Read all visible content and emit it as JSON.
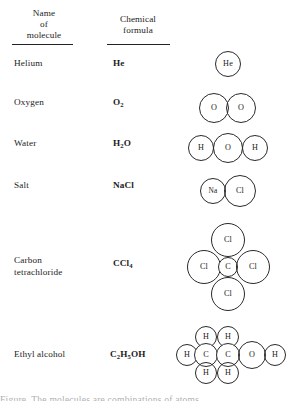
{
  "figure": {
    "kind": "molecular-structure-table",
    "columns": [
      {
        "id": "name",
        "header_lines": [
          "Name",
          "of",
          "molecule"
        ]
      },
      {
        "id": "formula",
        "header_lines": [
          "Chemical",
          "formula"
        ]
      },
      {
        "id": "model",
        "header_lines": []
      }
    ]
  },
  "rows": [
    {
      "name": "Helium",
      "formula": [
        {
          "t": "He"
        }
      ],
      "model": {
        "atoms": [
          {
            "label": "He",
            "cx": 52,
            "cy": 14,
            "r": 13
          }
        ]
      }
    },
    {
      "name": "Oxygen",
      "formula": [
        {
          "t": "O"
        },
        {
          "t": "2",
          "sub": true
        }
      ],
      "model": {
        "atoms": [
          {
            "label": "O",
            "cx": 38,
            "cy": 17,
            "r": 15
          },
          {
            "label": "O",
            "cx": 65,
            "cy": 17,
            "r": 15
          }
        ]
      }
    },
    {
      "name": "Water",
      "formula": [
        {
          "t": "H"
        },
        {
          "t": "2",
          "sub": true
        },
        {
          "t": "O"
        }
      ],
      "model": {
        "atoms": [
          {
            "label": "H",
            "cx": 25,
            "cy": 17,
            "r": 13
          },
          {
            "label": "O",
            "cx": 52,
            "cy": 17,
            "r": 15
          },
          {
            "label": "H",
            "cx": 79,
            "cy": 17,
            "r": 13
          }
        ]
      }
    },
    {
      "name": "Salt",
      "formula": [
        {
          "t": "NaCl"
        }
      ],
      "model": {
        "atoms": [
          {
            "label": "Na",
            "cx": 37,
            "cy": 17,
            "r": 13,
            "small": true
          },
          {
            "label": "Cl",
            "cx": 64,
            "cy": 17,
            "r": 16
          }
        ]
      }
    },
    {
      "name": "Carbon tetrachloride",
      "name_lines": [
        "Carbon",
        "tetrachloride"
      ],
      "formula": [
        {
          "t": "CCl"
        },
        {
          "t": "4",
          "sub": true
        }
      ],
      "model": {
        "atoms": [
          {
            "label": "Cl",
            "cx": 52,
            "cy": 17,
            "r": 17
          },
          {
            "label": "Cl",
            "cx": 28,
            "cy": 44,
            "r": 17
          },
          {
            "label": "C",
            "cx": 52,
            "cy": 44,
            "r": 10
          },
          {
            "label": "Cl",
            "cx": 77,
            "cy": 44,
            "r": 17
          },
          {
            "label": "Cl",
            "cx": 52,
            "cy": 71,
            "r": 17
          }
        ]
      }
    },
    {
      "name": "Ethyl alcohol",
      "formula": [
        {
          "t": "C"
        },
        {
          "t": "2",
          "sub": true
        },
        {
          "t": "H"
        },
        {
          "t": "5",
          "sub": true
        },
        {
          "t": "OH"
        }
      ],
      "model": {
        "atoms": [
          {
            "label": "H",
            "cx": 30,
            "cy": 22,
            "r": 11
          },
          {
            "label": "H",
            "cx": 52,
            "cy": 22,
            "r": 11
          },
          {
            "label": "H",
            "cx": 11,
            "cy": 40,
            "r": 11
          },
          {
            "label": "C",
            "cx": 30,
            "cy": 40,
            "r": 12
          },
          {
            "label": "C",
            "cx": 52,
            "cy": 40,
            "r": 12
          },
          {
            "label": "O",
            "cx": 76,
            "cy": 40,
            "r": 14
          },
          {
            "label": "H",
            "cx": 99,
            "cy": 40,
            "r": 11
          },
          {
            "label": "H",
            "cx": 30,
            "cy": 58,
            "r": 11
          },
          {
            "label": "H",
            "cx": 52,
            "cy": 58,
            "r": 11
          }
        ]
      }
    }
  ],
  "caption": {
    "text": "Figure. The molecules are combinations of atoms."
  },
  "colors": {
    "ink": "#1c1c1c",
    "stroke": "#2a2a2a",
    "page": "#ffffff"
  }
}
